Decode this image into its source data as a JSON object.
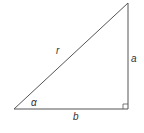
{
  "diagram": {
    "type": "right-triangle",
    "line_color": "#555555",
    "vertices": {
      "angle_vertex": [
        14,
        109
      ],
      "right_angle_vertex": [
        128,
        109
      ],
      "top_vertex": [
        128,
        3
      ]
    },
    "labels": {
      "hypotenuse": "r",
      "vertical_side": "a",
      "horizontal_side": "b",
      "angle": "α"
    },
    "right_angle_marker": true
  }
}
